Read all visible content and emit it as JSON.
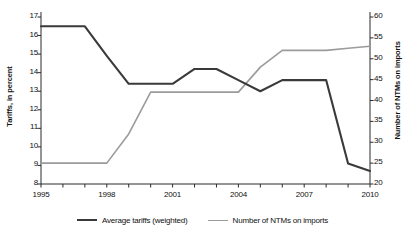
{
  "chart_data": {
    "type": "line",
    "title": "",
    "xlabel": "",
    "ylabel": "Tariffs, in percent",
    "y2label": "Number of NTMs on imports",
    "x": [
      1995,
      1996,
      1997,
      1998,
      1999,
      2000,
      2001,
      2002,
      2003,
      2004,
      2005,
      2006,
      2007,
      2008,
      2009,
      2010
    ],
    "xlim": [
      1995,
      2010
    ],
    "ylim": [
      8,
      17
    ],
    "y2lim": [
      20,
      60
    ],
    "xticks": [
      1995,
      1996,
      1997,
      1998,
      1999,
      2000,
      2001,
      2002,
      2003,
      2004,
      2005,
      2006,
      2007,
      2008,
      2009,
      2010
    ],
    "xtick_labels": [
      "1995",
      "",
      "",
      "1998",
      "",
      "",
      "2001",
      "",
      "",
      "2004",
      "",
      "",
      "2007",
      "",
      "",
      "2010"
    ],
    "yticks": [
      8,
      9,
      10,
      11,
      12,
      13,
      14,
      15,
      16,
      17
    ],
    "ytick_labels": [
      "8",
      "9",
      "10",
      "11",
      "12",
      "13",
      "14",
      "15",
      "16",
      "17"
    ],
    "y2ticks": [
      20,
      25,
      30,
      35,
      40,
      45,
      50,
      55,
      60
    ],
    "y2tick_labels": [
      "20",
      "25",
      "30",
      "35",
      "40",
      "45",
      "50",
      "55",
      "60"
    ],
    "grid": false,
    "legend_position": "bottom",
    "series": [
      {
        "name": "Average tariffs (weighted)",
        "axis": "left",
        "color": "#3a3a3a",
        "values": [
          16.5,
          16.5,
          16.5,
          14.9,
          13.4,
          13.4,
          13.4,
          14.2,
          14.2,
          13.6,
          13.0,
          13.6,
          13.6,
          13.6,
          9.1,
          8.7
        ]
      },
      {
        "name": "Number of NTMs on imports",
        "axis": "right",
        "color": "#9b9b9b",
        "values": [
          25,
          25,
          25,
          25,
          32,
          42,
          42,
          42,
          42,
          42,
          48,
          52,
          52,
          52,
          52.5,
          53
        ]
      }
    ]
  },
  "legend": {
    "items": [
      {
        "label": "Average tariffs (weighted)",
        "color": "#3a3a3a"
      },
      {
        "label": "Number of NTMs on imports",
        "color": "#9b9b9b"
      }
    ]
  }
}
